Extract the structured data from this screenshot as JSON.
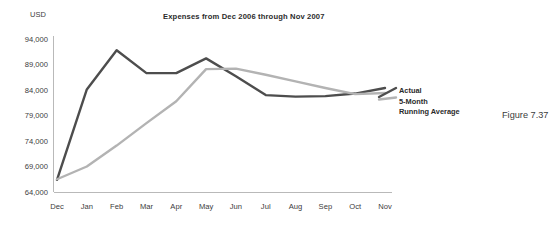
{
  "figure": {
    "caption": "Figure 7.37"
  },
  "chart_data": {
    "type": "line",
    "title": "Expenses from Dec 2006 through Nov 2007",
    "xlabel": "",
    "ylabel": "USD",
    "ylim": [
      64000,
      94000
    ],
    "yticks": [
      64000,
      69000,
      74000,
      79000,
      84000,
      89000,
      94000
    ],
    "ytick_labels": [
      "64,000",
      "69,000",
      "74,000",
      "79,000",
      "84,000",
      "89,000",
      "94,000"
    ],
    "grid": false,
    "legend_position": "right-inside",
    "categories": [
      "Dec",
      "Jan",
      "Feb",
      "Mar",
      "Apr",
      "May",
      "Jun",
      "Jul",
      "Aug",
      "Sep",
      "Oct",
      "Nov"
    ],
    "series": [
      {
        "name": "Actual",
        "color": "#4d4d4d",
        "values": [
          66400,
          84100,
          91800,
          87300,
          87300,
          90200,
          86700,
          83000,
          82700,
          82800,
          83300,
          84400
        ]
      },
      {
        "name": "5-Month Running Average",
        "color": "#b3b3b3",
        "values": [
          66500,
          69000,
          73100,
          77500,
          81800,
          88100,
          88200,
          87000,
          85700,
          84400,
          83200,
          83400
        ]
      }
    ]
  },
  "legend": {
    "entries": [
      {
        "label_line1": "Actual",
        "label_line2": ""
      },
      {
        "label_line1": "5-Month",
        "label_line2": "Running Average"
      }
    ]
  }
}
